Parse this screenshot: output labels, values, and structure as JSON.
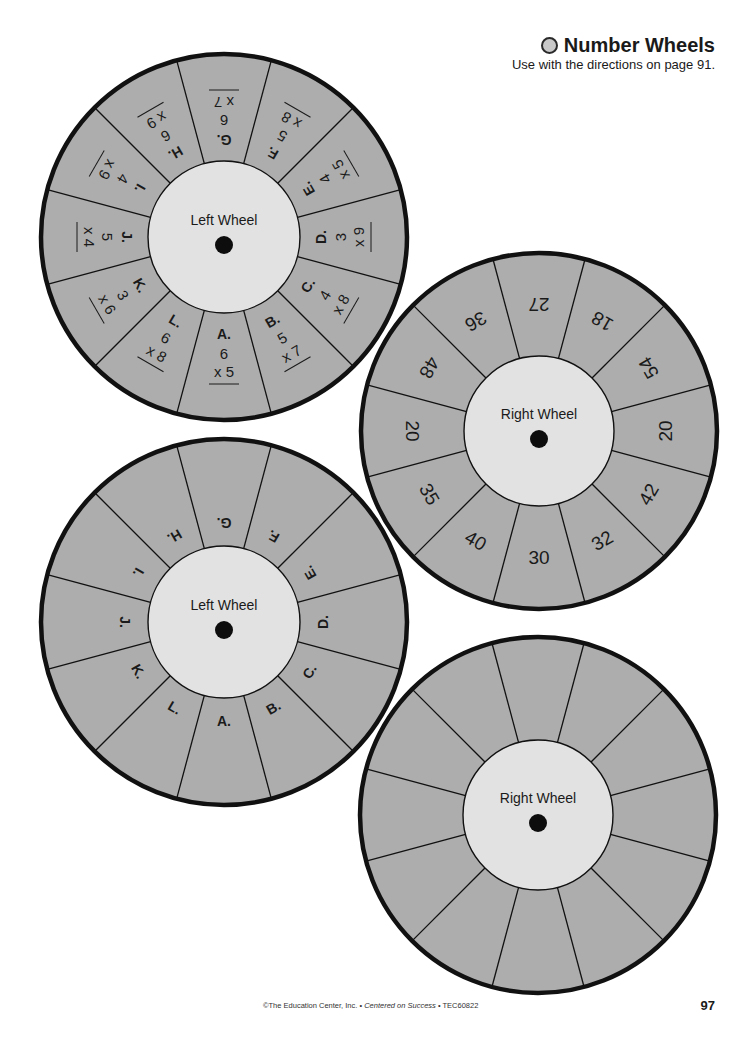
{
  "header": {
    "title": "Number Wheels",
    "subtitle": "Use with the directions on page 91."
  },
  "colors": {
    "segment_fill": "#adadad",
    "hub_fill": "#e2e2e2",
    "outline": "#111111",
    "pin": "#0d0d0d"
  },
  "wheels": [
    {
      "id": "left-wheel-filled",
      "label": "Left Wheel",
      "cx": 224,
      "cy": 237,
      "r": 183,
      "hub_r": 76,
      "segments": [
        {
          "letter": "A.",
          "top": "6",
          "bottom": "x 5"
        },
        {
          "letter": "B.",
          "top": "5",
          "bottom": "x 7"
        },
        {
          "letter": "C.",
          "top": "4",
          "bottom": "x 8"
        },
        {
          "letter": "D.",
          "top": "3",
          "bottom": "x 9"
        },
        {
          "letter": "E.",
          "top": "4",
          "bottom": "x 5"
        },
        {
          "letter": "F.",
          "top": "5",
          "bottom": "x 8"
        },
        {
          "letter": "G.",
          "top": "6",
          "bottom": "x 7"
        },
        {
          "letter": "H.",
          "top": "6",
          "bottom": "x 9"
        },
        {
          "letter": "I.",
          "top": "4",
          "bottom": "x 9"
        },
        {
          "letter": "J.",
          "top": "5",
          "bottom": "x 4"
        },
        {
          "letter": "K.",
          "top": "3",
          "bottom": "x 6"
        },
        {
          "letter": "L.",
          "top": "6",
          "bottom": "x 8"
        }
      ]
    },
    {
      "id": "right-wheel-filled",
      "label": "Right Wheel",
      "cx": 539,
      "cy": 431,
      "r": 178,
      "hub_r": 75,
      "segments": [
        {
          "value": "30"
        },
        {
          "value": "32"
        },
        {
          "value": "42"
        },
        {
          "value": "20"
        },
        {
          "value": "54"
        },
        {
          "value": "18"
        },
        {
          "value": "27"
        },
        {
          "value": "36"
        },
        {
          "value": "48"
        },
        {
          "value": "20"
        },
        {
          "value": "35"
        },
        {
          "value": "40"
        }
      ]
    },
    {
      "id": "left-wheel-blank",
      "label": "Left Wheel",
      "cx": 224,
      "cy": 622,
      "r": 183,
      "hub_r": 76,
      "segments": [
        {
          "letter": "A."
        },
        {
          "letter": "B."
        },
        {
          "letter": "C."
        },
        {
          "letter": "D."
        },
        {
          "letter": "E."
        },
        {
          "letter": "F."
        },
        {
          "letter": "G."
        },
        {
          "letter": "H."
        },
        {
          "letter": "I."
        },
        {
          "letter": "J."
        },
        {
          "letter": "K."
        },
        {
          "letter": "L."
        }
      ]
    },
    {
      "id": "right-wheel-blank",
      "label": "Right Wheel",
      "cx": 538,
      "cy": 815,
      "r": 178,
      "hub_r": 75,
      "segments": [
        {},
        {},
        {},
        {},
        {},
        {},
        {},
        {},
        {},
        {},
        {},
        {}
      ]
    }
  ],
  "footer": {
    "copyright_prefix": "©The Education Center, Inc. • ",
    "book_title": "Centered on Success",
    "code_suffix": " • TEC60822",
    "page_number": "97"
  }
}
